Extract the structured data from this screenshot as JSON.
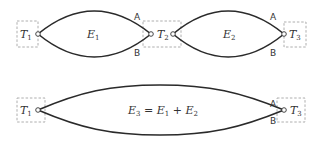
{
  "diagram": {
    "top_row": {
      "terminals": [
        {
          "name": "T",
          "sub": "1"
        },
        {
          "name": "T",
          "sub": "2"
        },
        {
          "name": "T",
          "sub": "3"
        }
      ],
      "edges": [
        {
          "name": "E",
          "sub": "1",
          "label_a": "A",
          "label_b": "B"
        },
        {
          "name": "E",
          "sub": "2",
          "label_a": "A",
          "label_b": "B"
        }
      ]
    },
    "bottom_row": {
      "terminals": [
        {
          "name": "T",
          "sub": "1"
        },
        {
          "name": "T",
          "sub": "3"
        }
      ],
      "edge": {
        "lhs_name": "E",
        "lhs_sub": "3",
        "equals": " = ",
        "t1_name": "E",
        "t1_sub": "1",
        "plus": " + ",
        "t2_name": "E",
        "t2_sub": "2",
        "label_a": "A",
        "label_b": "B"
      }
    }
  }
}
